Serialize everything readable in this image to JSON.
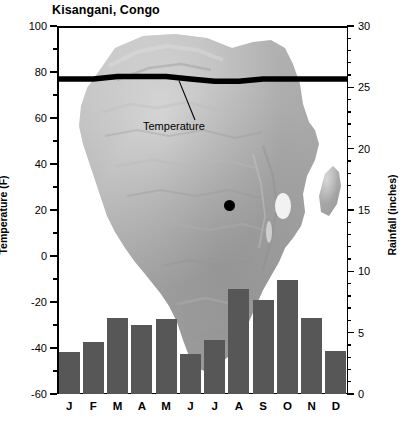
{
  "title": "Kisangani, Congo",
  "axes": {
    "left_title": "Temperature (F)",
    "right_title": "Rainfall (inches)",
    "left_ticks": [
      "100",
      "80",
      "60",
      "40",
      "20",
      "0",
      "-20",
      "-40",
      "-60"
    ],
    "right_ticks": [
      "30",
      "25",
      "20",
      "15",
      "10",
      "5",
      "0"
    ]
  },
  "annotations": {
    "temperature_label": "Temperature",
    "city_marker": "kisangani-location-dot"
  },
  "chart_data": {
    "type": "bar",
    "title": "Kisangani, Congo",
    "categories": [
      "J",
      "F",
      "M",
      "A",
      "M",
      "J",
      "J",
      "A",
      "S",
      "O",
      "N",
      "D"
    ],
    "month_names": [
      "January",
      "February",
      "March",
      "April",
      "May",
      "June",
      "July",
      "August",
      "September",
      "October",
      "November",
      "December"
    ],
    "xlabel": "",
    "ylabel": "Temperature (F)",
    "ylabel_secondary": "Rainfall (inches)",
    "ylim": [
      -60,
      100
    ],
    "ylim_secondary": [
      0,
      30
    ],
    "grid": false,
    "legend": "none",
    "series": [
      {
        "name": "Rainfall",
        "type": "bar",
        "axis": "right",
        "unit": "inches",
        "color": "#575757",
        "values": [
          3.4,
          4.2,
          6.2,
          5.6,
          6.1,
          3.3,
          4.4,
          8.6,
          7.7,
          9.3,
          6.2,
          3.5
        ]
      },
      {
        "name": "Temperature",
        "type": "line",
        "axis": "left",
        "unit": "F",
        "color": "#000000",
        "values": [
          77,
          77,
          78,
          78,
          78,
          77,
          76,
          76,
          77,
          77,
          77,
          77
        ]
      }
    ]
  }
}
